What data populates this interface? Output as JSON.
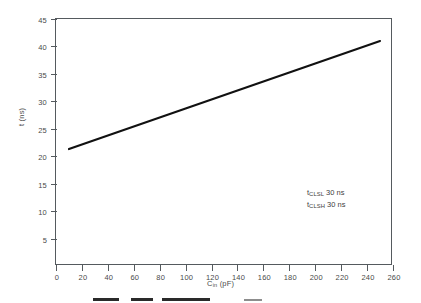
{
  "chart_data": {
    "type": "line",
    "title": "",
    "subtitle": "",
    "xlabel_plain": "Cin (pF)",
    "ylabel_plain": "t (ns)",
    "xlabel": {
      "base": "C",
      "sub": "in",
      "unit": " (pF)"
    },
    "ylabel": {
      "base": "t",
      "unit": " (ns)"
    },
    "xlim": [
      0,
      260
    ],
    "ylim": [
      0,
      45
    ],
    "grid": false,
    "legend_position": "none",
    "xticks": [
      0,
      20,
      40,
      60,
      80,
      100,
      120,
      140,
      160,
      180,
      200,
      220,
      240,
      260
    ],
    "yticks": [
      5,
      10,
      15,
      20,
      25,
      30,
      35,
      40,
      45
    ],
    "series": [
      {
        "name": "t vs Cin",
        "color": "#111111",
        "x": [
          10,
          50,
          100,
          150,
          200,
          250
        ],
        "values": [
          21.3,
          24.6,
          28.7,
          32.8,
          36.9,
          41.0
        ]
      }
    ],
    "annotations": [
      {
        "base": "t",
        "sub": "CLSL",
        "value": "30 ns",
        "text": "tCLSL 30 ns"
      },
      {
        "base": "t",
        "sub": "CLSH",
        "value": "30 ns",
        "text": "tCLSH 30 ns"
      }
    ],
    "colors": {
      "line": "#111111",
      "axis": "#555a5e",
      "text": "#4a4a4a",
      "background": "#ffffff"
    }
  }
}
